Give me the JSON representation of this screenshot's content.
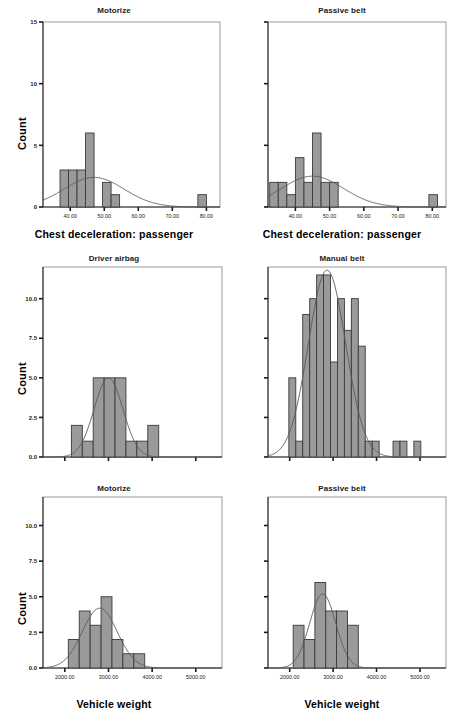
{
  "figure": {
    "type": "histogram-grid",
    "rows": 3,
    "cols": 2,
    "bar_fill": "#9a9a9a",
    "bar_stroke": "#3a3a3a",
    "curve_color": "#5a5a5a",
    "frame_color": "#9b9b9b",
    "background": "#ffffff"
  },
  "chart_data": [
    {
      "type": "bar",
      "id": "panel-top-left",
      "title": "Motorize",
      "xlabel": "Chest deceleration: passenger",
      "ylabel": "Count",
      "xlim": [
        32,
        84
      ],
      "ylim": [
        0,
        15
      ],
      "yticks": [
        0,
        5,
        10,
        15
      ],
      "ytick_labels": [
        "0",
        "5",
        "10",
        "15"
      ],
      "xticks": [
        40,
        50,
        60,
        70,
        80
      ],
      "xtick_labels": [
        "40.00",
        "50.00",
        "60.00",
        "70.00",
        "80.00"
      ],
      "grid": false,
      "legend": "none",
      "bin_width": 2.5,
      "bins": [
        {
          "x0": 37.0,
          "x1": 39.5,
          "count": 3
        },
        {
          "x0": 39.5,
          "x1": 42.0,
          "count": 3
        },
        {
          "x0": 42.0,
          "x1": 44.5,
          "count": 3
        },
        {
          "x0": 44.5,
          "x1": 47.0,
          "count": 6
        },
        {
          "x0": 49.5,
          "x1": 52.0,
          "count": 2
        },
        {
          "x0": 52.0,
          "x1": 54.5,
          "count": 1
        },
        {
          "x0": 77.5,
          "x1": 80.0,
          "count": 1
        }
      ],
      "normal_curve": {
        "mean": 47.0,
        "sd": 8.8,
        "peak_count": 2.4
      }
    },
    {
      "type": "bar",
      "id": "panel-top-right",
      "title": "Passive belt",
      "xlabel": "Chest deceleration: passenger",
      "ylabel": "",
      "xlim": [
        32,
        84
      ],
      "ylim": [
        0,
        15
      ],
      "yticks": [
        0,
        5,
        10,
        15
      ],
      "ytick_labels": [
        "",
        "",
        "",
        ""
      ],
      "xticks": [
        40,
        50,
        60,
        70,
        80
      ],
      "xtick_labels": [
        "40.00",
        "50.00",
        "60.00",
        "70.00",
        "80.00"
      ],
      "grid": false,
      "legend": "none",
      "bin_width": 2.5,
      "bins": [
        {
          "x0": 32.5,
          "x1": 35.0,
          "count": 2
        },
        {
          "x0": 35.0,
          "x1": 37.5,
          "count": 2
        },
        {
          "x0": 37.5,
          "x1": 40.0,
          "count": 1
        },
        {
          "x0": 40.0,
          "x1": 42.5,
          "count": 4
        },
        {
          "x0": 42.5,
          "x1": 45.0,
          "count": 2
        },
        {
          "x0": 45.0,
          "x1": 47.5,
          "count": 6
        },
        {
          "x0": 47.5,
          "x1": 50.0,
          "count": 2
        },
        {
          "x0": 50.0,
          "x1": 52.5,
          "count": 2
        },
        {
          "x0": 79.0,
          "x1": 81.5,
          "count": 1
        }
      ],
      "normal_curve": {
        "mean": 45.0,
        "sd": 9.0,
        "peak_count": 2.5
      }
    },
    {
      "type": "bar",
      "id": "panel-middle-left",
      "title": "Driver airbag",
      "xlabel": "",
      "ylabel": "Count",
      "xlim": [
        1500,
        5600
      ],
      "ylim": [
        0,
        12
      ],
      "yticks": [
        0.0,
        2.5,
        5.0,
        7.5,
        10.0
      ],
      "ytick_labels": [
        "0.0",
        "2.5",
        "5.0",
        "7.5",
        "10.0"
      ],
      "xticks": [
        2000,
        3000,
        4000,
        5000
      ],
      "xtick_labels": [
        "",
        "",
        "",
        ""
      ],
      "grid": false,
      "legend": "none",
      "bin_width": 250,
      "bins": [
        {
          "x0": 2150,
          "x1": 2400,
          "count": 2
        },
        {
          "x0": 2400,
          "x1": 2650,
          "count": 1
        },
        {
          "x0": 2650,
          "x1": 2900,
          "count": 5
        },
        {
          "x0": 2900,
          "x1": 3150,
          "count": 5
        },
        {
          "x0": 3150,
          "x1": 3400,
          "count": 5
        },
        {
          "x0": 3400,
          "x1": 3650,
          "count": 1
        },
        {
          "x0": 3650,
          "x1": 3900,
          "count": 1
        },
        {
          "x0": 3900,
          "x1": 4150,
          "count": 2
        }
      ],
      "normal_curve": {
        "mean": 3000,
        "sd": 330,
        "peak_count": 5.0
      }
    },
    {
      "type": "bar",
      "id": "panel-middle-right",
      "title": "Manual belt",
      "xlabel": "",
      "ylabel": "",
      "xlim": [
        1500,
        5600
      ],
      "ylim": [
        0,
        12
      ],
      "yticks": [
        0.0,
        2.5,
        5.0,
        7.5,
        10.0
      ],
      "ytick_labels": [
        "",
        "",
        "",
        "",
        ""
      ],
      "xticks": [
        2000,
        3000,
        4000,
        5000
      ],
      "xtick_labels": [
        "",
        "",
        "",
        ""
      ],
      "grid": false,
      "legend": "none",
      "bin_width": 160,
      "bins": [
        {
          "x0": 1980,
          "x1": 2140,
          "count": 5
        },
        {
          "x0": 2140,
          "x1": 2300,
          "count": 1
        },
        {
          "x0": 2300,
          "x1": 2460,
          "count": 9
        },
        {
          "x0": 2460,
          "x1": 2620,
          "count": 10
        },
        {
          "x0": 2620,
          "x1": 2780,
          "count": 11.5
        },
        {
          "x0": 2780,
          "x1": 2940,
          "count": 11.5
        },
        {
          "x0": 2940,
          "x1": 3100,
          "count": 6
        },
        {
          "x0": 3100,
          "x1": 3260,
          "count": 10
        },
        {
          "x0": 3260,
          "x1": 3420,
          "count": 8
        },
        {
          "x0": 3420,
          "x1": 3580,
          "count": 10
        },
        {
          "x0": 3580,
          "x1": 3740,
          "count": 7
        },
        {
          "x0": 3740,
          "x1": 3900,
          "count": 1
        },
        {
          "x0": 3900,
          "x1": 4060,
          "count": 1
        },
        {
          "x0": 4380,
          "x1": 4540,
          "count": 1
        },
        {
          "x0": 4540,
          "x1": 4700,
          "count": 1
        },
        {
          "x0": 4860,
          "x1": 5020,
          "count": 1
        }
      ],
      "normal_curve": {
        "mean": 2860,
        "sd": 430,
        "peak_count": 11.8
      }
    },
    {
      "type": "bar",
      "id": "panel-bottom-left",
      "title": "Motorize",
      "xlabel": "Vehicle weight",
      "ylabel": "Count",
      "xlim": [
        1500,
        5600
      ],
      "ylim": [
        0,
        12
      ],
      "yticks": [
        0.0,
        2.5,
        5.0,
        7.5,
        10.0
      ],
      "ytick_labels": [
        "0.0",
        "2.5",
        "5.0",
        "7.5",
        "10.0"
      ],
      "xticks": [
        2000,
        3000,
        4000,
        5000
      ],
      "xtick_labels": [
        "2000.00",
        "3000.00",
        "4000.00",
        "5000.00"
      ],
      "grid": false,
      "legend": "none",
      "bin_width": 250,
      "bins": [
        {
          "x0": 2080,
          "x1": 2330,
          "count": 2
        },
        {
          "x0": 2330,
          "x1": 2580,
          "count": 4
        },
        {
          "x0": 2580,
          "x1": 2830,
          "count": 3
        },
        {
          "x0": 2830,
          "x1": 3080,
          "count": 5
        },
        {
          "x0": 3080,
          "x1": 3330,
          "count": 2
        },
        {
          "x0": 3330,
          "x1": 3580,
          "count": 1
        },
        {
          "x0": 3580,
          "x1": 3830,
          "count": 1
        }
      ],
      "normal_curve": {
        "mean": 2800,
        "sd": 400,
        "peak_count": 4.2
      }
    },
    {
      "type": "bar",
      "id": "panel-bottom-right",
      "title": "Passive belt",
      "xlabel": "Vehicle weight",
      "ylabel": "",
      "xlim": [
        1500,
        5600
      ],
      "ylim": [
        0,
        12
      ],
      "yticks": [
        0.0,
        2.5,
        5.0,
        7.5,
        10.0
      ],
      "ytick_labels": [
        "",
        "",
        "",
        "",
        ""
      ],
      "xticks": [
        2000,
        3000,
        4000,
        5000
      ],
      "xtick_labels": [
        "2000.00",
        "3000.00",
        "4000.00",
        "5000.00"
      ],
      "grid": false,
      "legend": "none",
      "bin_width": 250,
      "bins": [
        {
          "x0": 2080,
          "x1": 2330,
          "count": 3
        },
        {
          "x0": 2330,
          "x1": 2580,
          "count": 2
        },
        {
          "x0": 2580,
          "x1": 2830,
          "count": 6
        },
        {
          "x0": 2830,
          "x1": 3080,
          "count": 4
        },
        {
          "x0": 3080,
          "x1": 3330,
          "count": 4
        },
        {
          "x0": 3330,
          "x1": 3580,
          "count": 3
        }
      ],
      "normal_curve": {
        "mean": 2760,
        "sd": 300,
        "peak_count": 5.2
      }
    }
  ]
}
